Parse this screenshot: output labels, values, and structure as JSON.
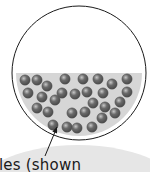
{
  "diagram": {
    "circle": {
      "cx": 79,
      "cy": 73,
      "r": 67,
      "stroke": "#1a1a1a",
      "fill": "#ffffff"
    },
    "fluid": {
      "top_y": 73,
      "color": "#d6d6d6",
      "inset": 4
    },
    "callout_blob": {
      "cx": 78,
      "cy": 200,
      "rx": 110,
      "ry": 55,
      "color": "#e6e6e6"
    },
    "particle_color": "#6b6b6b",
    "particle_highlight": "#c8c8c8",
    "particle_radius": 5.2,
    "particles": [
      [
        25,
        80
      ],
      [
        37,
        80
      ],
      [
        65,
        79
      ],
      [
        83,
        79
      ],
      [
        98,
        79
      ],
      [
        112,
        84
      ],
      [
        127,
        79
      ],
      [
        47,
        86
      ],
      [
        28,
        93
      ],
      [
        42,
        97
      ],
      [
        62,
        93
      ],
      [
        75,
        94
      ],
      [
        87,
        92
      ],
      [
        103,
        93
      ],
      [
        127,
        92
      ],
      [
        55,
        100
      ],
      [
        93,
        103
      ],
      [
        120,
        102
      ],
      [
        37,
        108
      ],
      [
        48,
        112
      ],
      [
        72,
        113
      ],
      [
        85,
        112
      ],
      [
        105,
        107
      ],
      [
        115,
        113
      ],
      [
        102,
        118
      ],
      [
        53,
        125
      ],
      [
        67,
        127
      ],
      [
        77,
        128
      ],
      [
        92,
        127
      ]
    ],
    "arrow": {
      "x1": 45,
      "y1": 156,
      "x2": 57,
      "y2": 127,
      "color": "#1a1a1a"
    },
    "label": "les (shown"
  }
}
